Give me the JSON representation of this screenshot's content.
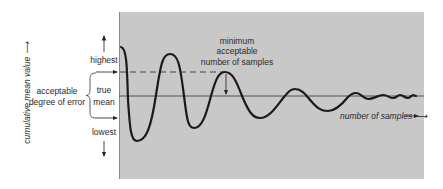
{
  "diagram": {
    "panel_color": "#c8c8c8",
    "curve_color": "#1a1a1a",
    "y_axis_label": "cumulative mean value ⟶",
    "x_axis_label": "number of samples ⟶",
    "levels": {
      "highest": "highest",
      "true_mean_line1": "true",
      "true_mean_line2": "mean",
      "lowest": "lowest"
    },
    "error_label": {
      "line1": "acceptable",
      "line2": "degree of error"
    },
    "annotation": {
      "line1": "minimum",
      "line2": "acceptable",
      "line3": "number of samples"
    }
  }
}
